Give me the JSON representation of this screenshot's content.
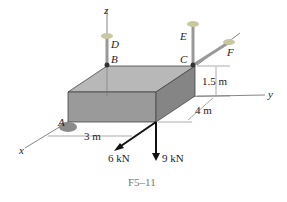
{
  "figure": {
    "caption": "F5–11",
    "axes": {
      "x": "x",
      "y": "y",
      "z": "z"
    },
    "points": {
      "A": "A",
      "B": "B",
      "C": "C",
      "D": "D",
      "E": "E",
      "F": "F"
    },
    "dimensions": {
      "height": "1.5 m",
      "depth": "4 m",
      "offset": "3 m"
    },
    "loads": {
      "load_horizontal": "6 kN",
      "load_vertical": "9 kN"
    }
  },
  "colors": {
    "box_top": "#b8b8b8",
    "box_front": "#9a9a9a",
    "box_side": "#858585",
    "edge": "#444444",
    "arrow": "#111111"
  }
}
